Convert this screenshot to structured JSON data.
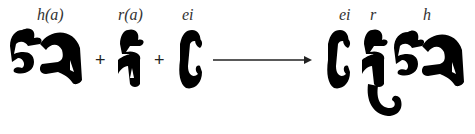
{
  "diagram": {
    "inputs": [
      {
        "glyph": "ហ",
        "label": "h(a)"
      },
      {
        "glyph": "រ",
        "label": "r(a)"
      },
      {
        "glyph": "េ",
        "label": "ei"
      }
    ],
    "operators": [
      "+",
      "+"
    ],
    "arrow": "→",
    "output": {
      "glyph": "ហ្រេ",
      "labels": [
        "ei",
        "r",
        "h"
      ]
    },
    "colors": {
      "glyph": "#000000",
      "label": "#333333",
      "arrow": "#222222"
    }
  }
}
